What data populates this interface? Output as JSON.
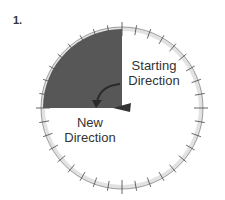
{
  "step": {
    "number": "1."
  },
  "dial": {
    "center": [
      122,
      108
    ],
    "radius": 79,
    "shaded_quadrant": "top-left",
    "shade_color": "#555555",
    "ring_color": "#dddddd",
    "tick_interval_deg": 10
  },
  "labels": {
    "starting_direction_line1": "Starting",
    "starting_direction_line2": "Direction",
    "new_direction_line1": "New",
    "new_direction_line2": "Direction"
  },
  "arrow": {
    "type": "curved",
    "from": "starting-direction",
    "to": "new-direction",
    "rotation": "counterclockwise 90°"
  }
}
